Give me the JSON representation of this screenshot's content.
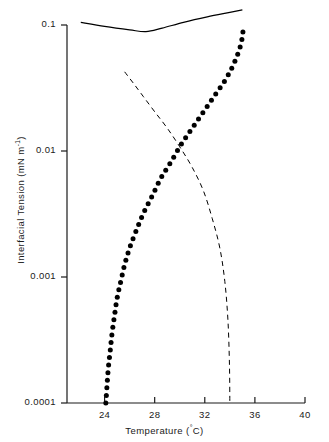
{
  "chart_data": {
    "type": "line",
    "title": "",
    "xlabel": "Temperature (°C)",
    "ylabel": "Interfacial Tension (mN m⁻¹)",
    "xlim": [
      21,
      40
    ],
    "ylim": [
      0.0001,
      0.1
    ],
    "yscale": "log",
    "xticks": [
      24,
      28,
      32,
      36,
      40
    ],
    "xtick_labels": [
      "24",
      "28",
      "32",
      "36",
      "40"
    ],
    "yticks": [
      0.1,
      0.01,
      0.001,
      0.0001
    ],
    "ytick_labels": [
      "0.1",
      "0.01",
      "0.001",
      "0.0001"
    ],
    "grid": false,
    "legend": "none",
    "series": [
      {
        "name": "upper-solid-curve",
        "style": "solid",
        "color": "#000000",
        "points": [
          [
            22.1,
            0.105
          ],
          [
            24.0,
            0.0975
          ],
          [
            26.0,
            0.0915
          ],
          [
            27.3,
            0.0885
          ],
          [
            28.6,
            0.0945
          ],
          [
            30.3,
            0.105
          ],
          [
            32.2,
            0.116
          ],
          [
            34.0,
            0.126
          ],
          [
            35.0,
            0.132
          ]
        ]
      },
      {
        "name": "dotted-rising-curve",
        "style": "dotted",
        "color": "#000000",
        "points": [
          [
            24.1,
            0.0001
          ],
          [
            24.2,
            0.00014
          ],
          [
            24.3,
            0.00019
          ],
          [
            24.45,
            0.00026
          ],
          [
            24.6,
            0.00036
          ],
          [
            24.8,
            0.0005
          ],
          [
            25.0,
            0.00068
          ],
          [
            25.3,
            0.00093
          ],
          [
            25.6,
            0.00125
          ],
          [
            26.0,
            0.0017
          ],
          [
            26.5,
            0.0023
          ],
          [
            27.1,
            0.0032
          ],
          [
            27.8,
            0.0044
          ],
          [
            28.5,
            0.0061
          ],
          [
            29.3,
            0.0082
          ],
          [
            30.1,
            0.0112
          ],
          [
            31.0,
            0.0152
          ],
          [
            31.9,
            0.0205
          ],
          [
            32.8,
            0.0277
          ],
          [
            33.7,
            0.0375
          ],
          [
            34.4,
            0.0515
          ],
          [
            34.9,
            0.0715
          ],
          [
            35.1,
            0.099
          ]
        ]
      },
      {
        "name": "dashed-falling-curve",
        "style": "dashed",
        "color": "#000000",
        "points": [
          [
            25.6,
            0.0425
          ],
          [
            26.3,
            0.0345
          ],
          [
            27.1,
            0.027
          ],
          [
            28.0,
            0.0205
          ],
          [
            29.0,
            0.0152
          ],
          [
            30.0,
            0.0108
          ],
          [
            31.0,
            0.0074
          ],
          [
            31.9,
            0.0048
          ],
          [
            32.6,
            0.0029
          ],
          [
            33.2,
            0.0017
          ],
          [
            33.6,
            0.00092
          ],
          [
            33.85,
            0.00045
          ],
          [
            33.97,
            0.0002
          ],
          [
            34.0,
            0.0001
          ]
        ]
      }
    ]
  },
  "axes": {
    "x_title": "Temperature (",
    "x_title_unit": "C)",
    "x_title_deg": "°",
    "y_title_main": "Interfacial Tension (mN m",
    "y_title_sup": "-1",
    "y_title_end": ")"
  }
}
